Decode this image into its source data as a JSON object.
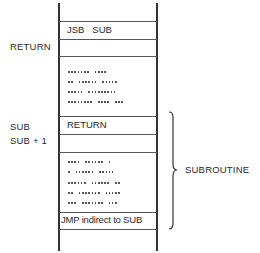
{
  "diagram": {
    "memory_column": {
      "cells": [
        {
          "id": "jsb",
          "text": "JSB   SUB"
        },
        {
          "id": "return-slot",
          "text": ""
        },
        {
          "id": "caller-code",
          "text": ""
        },
        {
          "id": "sub-entry",
          "text": "RETURN"
        },
        {
          "id": "sub-plus-1",
          "text": ""
        },
        {
          "id": "sub-body",
          "text": ""
        },
        {
          "id": "jmp",
          "text": "JMP indirect to SUB"
        },
        {
          "id": "tail",
          "text": ""
        }
      ]
    },
    "left_labels": {
      "return": "RETURN",
      "sub": "SUB",
      "sub_plus_1": "SUB + 1"
    },
    "brace_label": "SUBROUTINE",
    "caller_dots": [
      [
        7,
        4
      ],
      [
        2,
        6,
        5
      ],
      [
        5,
        9
      ],
      [
        8,
        4,
        3
      ]
    ],
    "subroutine_dots": [
      [
        4,
        6,
        1
      ],
      [
        1,
        6,
        5
      ],
      [
        6,
        6,
        2
      ],
      [
        2,
        7,
        5
      ],
      [
        3,
        7,
        3
      ]
    ]
  }
}
